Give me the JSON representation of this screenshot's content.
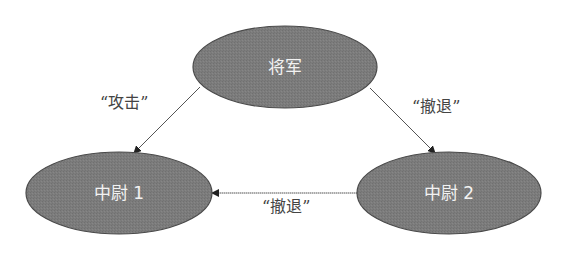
{
  "diagram": {
    "type": "directed-graph",
    "colors": {
      "node_fill": "#7a7a7a",
      "node_stroke": "#4a4a4a",
      "node_text": "#f2f2f2",
      "edge": "#555555",
      "edge_text": "#444444",
      "background": "#ffffff"
    },
    "nodes": [
      {
        "id": "general",
        "label": "将军",
        "cx": 285,
        "cy": 67,
        "rx": 92,
        "ry": 41
      },
      {
        "id": "lieutenant1",
        "label": "中尉 1",
        "cx": 119,
        "cy": 193,
        "rx": 93,
        "ry": 41
      },
      {
        "id": "lieutenant2",
        "label": "中尉 2",
        "cx": 449,
        "cy": 193,
        "rx": 92,
        "ry": 41
      }
    ],
    "edges": [
      {
        "from": "general",
        "to": "lieutenant1",
        "label": "“攻击”"
      },
      {
        "from": "general",
        "to": "lieutenant2",
        "label": "“撤退”"
      },
      {
        "from": "lieutenant2",
        "to": "lieutenant1",
        "label": "“撤退”"
      }
    ]
  }
}
